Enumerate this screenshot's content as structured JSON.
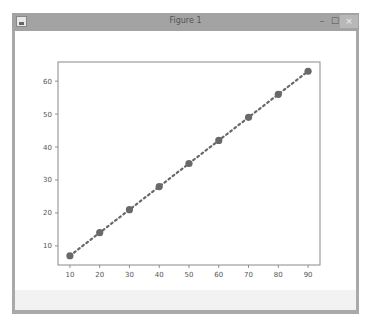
{
  "window": {
    "title": "Figure 1",
    "controls": {
      "minimize": "–",
      "maximize": "☐",
      "close": "×"
    }
  },
  "chart_data": {
    "type": "line",
    "title": "",
    "xlabel": "",
    "ylabel": "",
    "x": [
      10,
      20,
      30,
      40,
      50,
      60,
      70,
      80,
      90
    ],
    "series": [
      {
        "name": "y",
        "values": [
          7,
          14,
          21,
          28,
          35,
          42,
          49,
          56,
          63
        ],
        "color": "#696969",
        "linestyle": "dotted",
        "marker": "o"
      }
    ],
    "xticks": [
      10,
      20,
      30,
      40,
      50,
      60,
      70,
      80,
      90
    ],
    "yticks": [
      10,
      20,
      30,
      40,
      50,
      60
    ],
    "xlim": [
      6,
      94
    ],
    "ylim": [
      4.2,
      65.8
    ],
    "grid": false,
    "legend": null
  }
}
